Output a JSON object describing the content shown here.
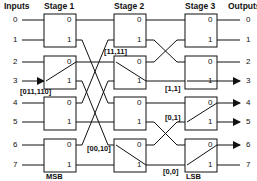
{
  "headers": {
    "inputs": "Inputs",
    "stage1": "Stage 1",
    "stage2": "Stage 2",
    "stage3": "Stage 3",
    "outputs": "Outputs"
  },
  "inputs": [
    "0",
    "1",
    "2",
    "3",
    "4",
    "5",
    "6",
    "7"
  ],
  "outputs": [
    "0",
    "1",
    "2",
    "3",
    "4",
    "5",
    "6",
    "7"
  ],
  "port_labels": {
    "upper": "0",
    "lower": "1"
  },
  "routing_tags": {
    "stage1_in": "[011,110]",
    "stage2_a": "[11,11]",
    "stage2_b": "[00,10]",
    "stage3_a": "[1,1]",
    "stage3_b": "[0,1]",
    "stage3_c": "[0,0]"
  },
  "bit_labels": {
    "msb": "MSB",
    "lsb": "LSB"
  },
  "colors": {
    "line": "#111111",
    "box_fill": "#ffffff",
    "background": "#ffffff"
  }
}
